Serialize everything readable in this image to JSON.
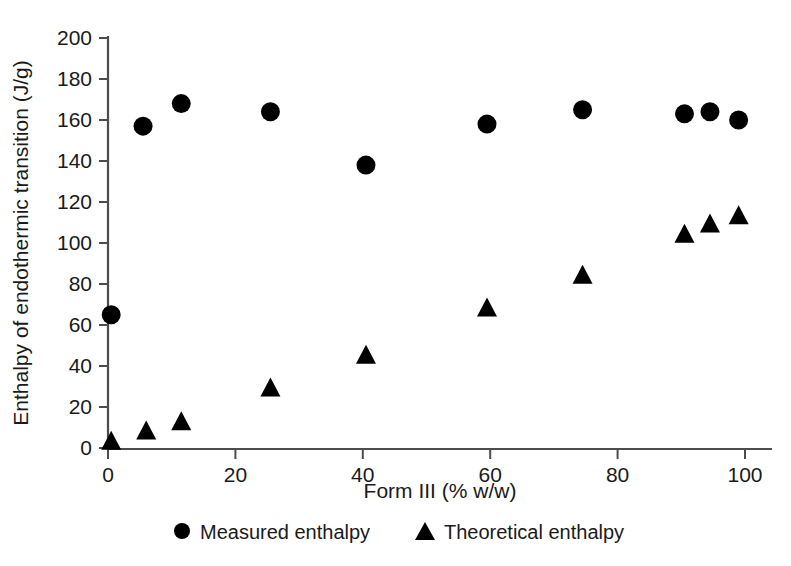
{
  "chart_data": {
    "type": "scatter",
    "title": "",
    "xlabel": "Form III (% w/w)",
    "ylabel": "Enthalpy of endothermic transition (J/g)",
    "xlim": [
      0,
      105
    ],
    "ylim": [
      0,
      200
    ],
    "xticks": [
      0,
      20,
      40,
      60,
      80,
      100
    ],
    "xtick_labels": [
      "0",
      "20",
      "40",
      "60",
      "80",
      "100"
    ],
    "yticks": [
      0,
      20,
      40,
      60,
      80,
      100,
      120,
      140,
      160,
      180,
      200
    ],
    "ytick_labels": [
      "0",
      "20",
      "40",
      "60",
      "80",
      "100",
      "120",
      "140",
      "160",
      "180",
      "200"
    ],
    "grid": false,
    "legend_position": "bottom",
    "series": [
      {
        "name": "Measured enthalpy",
        "marker": "circle",
        "color": "#000000",
        "points": [
          {
            "x": 0.5,
            "y": 65
          },
          {
            "x": 5.5,
            "y": 157
          },
          {
            "x": 11.5,
            "y": 168
          },
          {
            "x": 25.5,
            "y": 164
          },
          {
            "x": 40.5,
            "y": 138
          },
          {
            "x": 59.5,
            "y": 158
          },
          {
            "x": 74.5,
            "y": 165
          },
          {
            "x": 90.5,
            "y": 163
          },
          {
            "x": 94.5,
            "y": 164
          },
          {
            "x": 99.0,
            "y": 160
          }
        ]
      },
      {
        "name": "Theoretical enthalpy",
        "marker": "triangle",
        "color": "#000000",
        "points": [
          {
            "x": 0.5,
            "y": 3
          },
          {
            "x": 6.0,
            "y": 8
          },
          {
            "x": 11.5,
            "y": 12.5
          },
          {
            "x": 25.5,
            "y": 29
          },
          {
            "x": 40.5,
            "y": 45
          },
          {
            "x": 59.5,
            "y": 68
          },
          {
            "x": 74.5,
            "y": 84
          },
          {
            "x": 90.5,
            "y": 104
          },
          {
            "x": 94.5,
            "y": 109
          },
          {
            "x": 99.0,
            "y": 113
          }
        ]
      }
    ]
  },
  "legend": {
    "items": [
      {
        "marker": "circle-marker",
        "label": "Measured enthalpy"
      },
      {
        "marker": "triangle-marker",
        "label": "Theoretical enthalpy"
      }
    ]
  }
}
